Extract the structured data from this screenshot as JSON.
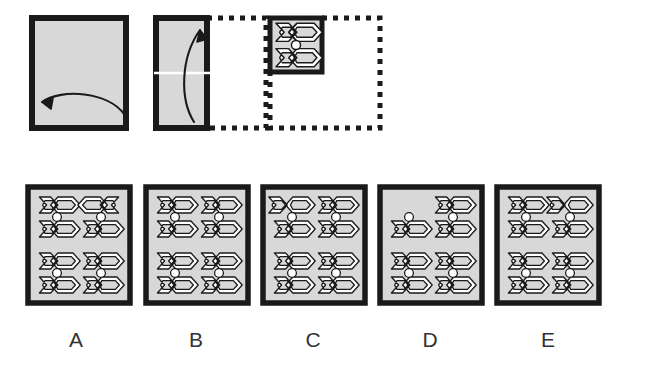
{
  "puzzle": {
    "type": "paper-folding-spatial-reasoning",
    "title": "",
    "fold_sequence": [
      {
        "step": 1,
        "name": "unfolded-sheet",
        "shape": "square",
        "fill": "#d8d8d8",
        "fold_arrow": "bottom-edge-curved-arrow-pointing-left",
        "arrow_direction": "right-to-left",
        "fold_line": "vertical-center"
      },
      {
        "step": 2,
        "name": "half-folded-sheet",
        "shape": "vertical-rectangle",
        "fill": "#d8d8d8",
        "ghost": "dashed-right-half",
        "fold_arrow": "curved-arrow-pointing-up-right",
        "arrow_direction": "bottom-to-top",
        "fold_line": "horizontal-center"
      },
      {
        "step": 3,
        "name": "quarter-folded-punched",
        "shape": "small-square",
        "fill": "#d8d8d8",
        "ghost": "dashed-outline-of-full-sheet",
        "pattern": "two-chevrons-with-center-circle"
      }
    ],
    "answer_options": [
      {
        "letter": "A",
        "name": "option-a",
        "cells": [
          {
            "row": 0,
            "col": 0,
            "top_chevron": "left",
            "bottom_chevron": "left",
            "circle": true
          },
          {
            "row": 0,
            "col": 1,
            "top_chevron": "right",
            "bottom_chevron": "left",
            "circle": true
          },
          {
            "row": 1,
            "col": 0,
            "top_chevron": "left",
            "bottom_chevron": "left",
            "circle": true
          },
          {
            "row": 1,
            "col": 1,
            "top_chevron": "left",
            "bottom_chevron": "left",
            "circle": true
          }
        ]
      },
      {
        "letter": "B",
        "name": "option-b",
        "cells": [
          {
            "row": 0,
            "col": 0,
            "top_chevron": "left",
            "bottom_chevron": "left",
            "circle": true
          },
          {
            "row": 0,
            "col": 1,
            "top_chevron": "left",
            "bottom_chevron": "left",
            "circle": true
          },
          {
            "row": 1,
            "col": 0,
            "top_chevron": "left",
            "bottom_chevron": "left",
            "circle": true
          },
          {
            "row": 1,
            "col": 1,
            "top_chevron": "left",
            "bottom_chevron": "left",
            "circle": true
          }
        ]
      },
      {
        "letter": "C",
        "name": "option-c",
        "cells": [
          {
            "row": 0,
            "col": 0,
            "top_chevron": "open-left",
            "bottom_chevron": "left",
            "circle": true
          },
          {
            "row": 0,
            "col": 1,
            "top_chevron": "left",
            "bottom_chevron": "left",
            "circle": true
          },
          {
            "row": 1,
            "col": 0,
            "top_chevron": "left",
            "bottom_chevron": "left",
            "circle": true
          },
          {
            "row": 1,
            "col": 1,
            "top_chevron": "left",
            "bottom_chevron": "left",
            "circle": true
          }
        ]
      },
      {
        "letter": "D",
        "name": "option-d",
        "cells": [
          {
            "row": 0,
            "col": 0,
            "top_chevron": "none",
            "bottom_chevron": "left",
            "circle": true
          },
          {
            "row": 0,
            "col": 1,
            "top_chevron": "left",
            "bottom_chevron": "left",
            "circle": true
          },
          {
            "row": 1,
            "col": 0,
            "top_chevron": "left",
            "bottom_chevron": "left",
            "circle": true
          },
          {
            "row": 1,
            "col": 1,
            "top_chevron": "left",
            "bottom_chevron": "left",
            "circle": true
          }
        ]
      },
      {
        "letter": "E",
        "name": "option-e",
        "cells": [
          {
            "row": 0,
            "col": 0,
            "top_chevron": "left",
            "bottom_chevron": "left",
            "circle": true
          },
          {
            "row": 0,
            "col": 1,
            "top_chevron": "open-left",
            "bottom_chevron": "left",
            "circle": true
          },
          {
            "row": 1,
            "col": 0,
            "top_chevron": "left",
            "bottom_chevron": "left",
            "circle": true
          },
          {
            "row": 1,
            "col": 1,
            "top_chevron": "left",
            "bottom_chevron": "left",
            "circle": true
          }
        ]
      }
    ],
    "labels": {
      "a": "A",
      "b": "B",
      "c": "C",
      "d": "D",
      "e": "E"
    },
    "colors": {
      "paper_fill": "#d8d8d8",
      "border": "#1a1a1a",
      "motif_stroke": "#1a1a1a",
      "motif_fill": "#ffffff",
      "dashed": "#1a1a1a",
      "label_text": "#333333",
      "background": "#ffffff"
    }
  }
}
